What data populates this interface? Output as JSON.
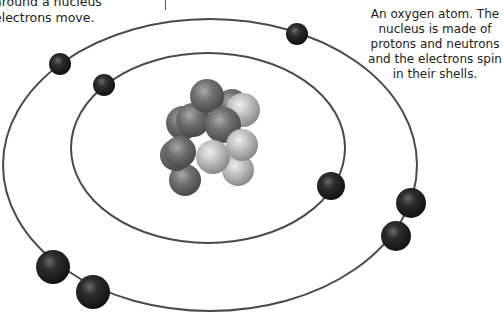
{
  "captions": {
    "left_line1": "around a nucleus",
    "left_line2": "electrons move.",
    "right": "An oxygen atom. The nucleus is made of protons and neutrons and the electrons spin in their shells."
  },
  "diagram": {
    "subject": "oxygen atom",
    "inner_shell": {
      "electrons": 2
    },
    "outer_shell": {
      "electrons": 6
    },
    "nucleus": {
      "protons": 8,
      "neutrons": 8
    },
    "colors": {
      "orbit": "#4a4a4a",
      "electron": "#2a2a2a",
      "proton": "#6e6e6e",
      "neutron": "#b5b5b5"
    }
  }
}
